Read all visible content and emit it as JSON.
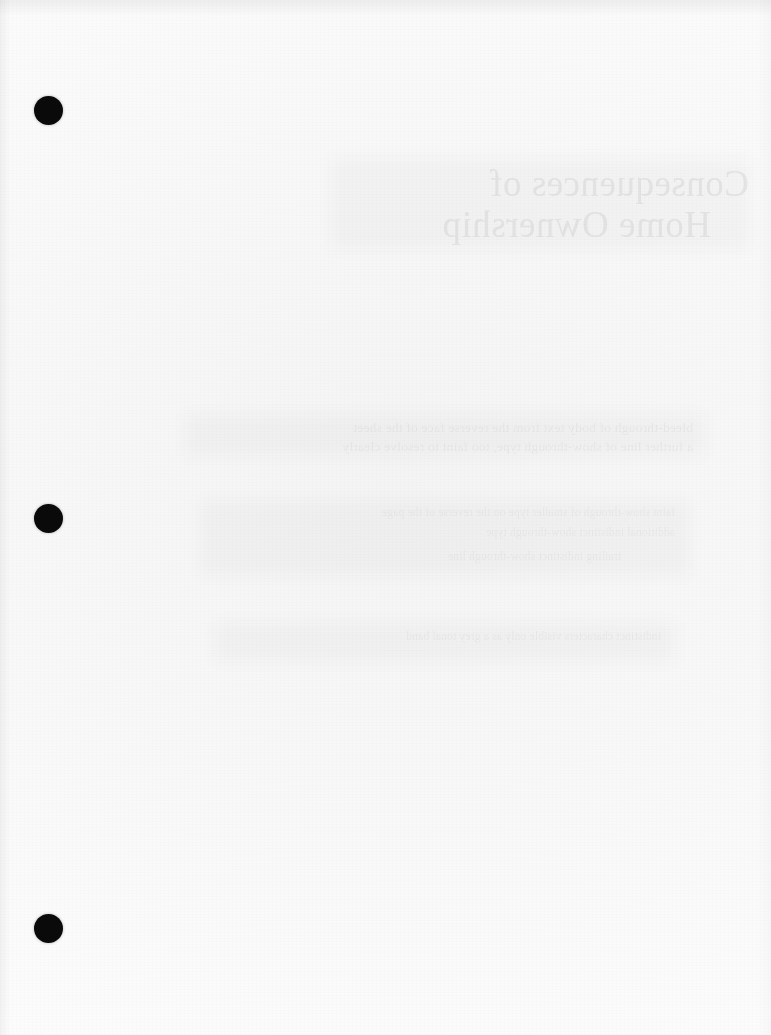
{
  "document": {
    "kind": "scanned-page",
    "side": "verso",
    "page_width": 771,
    "page_height": 1035,
    "paper_color": "#f8f8f8",
    "ink_color": "#0a0a0a",
    "description": "Blank reverse side of a three-hole-punched scanned document page with faint mirror-reversed show-through of the printed front side."
  },
  "punch_holes": [
    {
      "label": "top-punch-hole",
      "cx": 48,
      "cy": 110,
      "d": 29
    },
    {
      "label": "middle-punch-hole",
      "cx": 48,
      "cy": 518,
      "d": 29
    },
    {
      "label": "bottom-punch-hole",
      "cx": 48,
      "cy": 928,
      "d": 29
    }
  ],
  "bleed_through": {
    "note": "Text from the printed front face, seen in mirror image through the paper.",
    "title_lines": [
      "Consequences of",
      "Home Ownership"
    ],
    "body_lines": [
      "bleed-through of body text from the reverse face of the sheet",
      "a further line of show-through type, too faint to resolve clearly",
      "indistinct characters visible only as a grey tonal band"
    ],
    "small_lines": [
      "faint show-through of smaller type on the reverse of the page",
      "additional indistinct show-through type",
      "trailing indistinct show-through line"
    ]
  }
}
